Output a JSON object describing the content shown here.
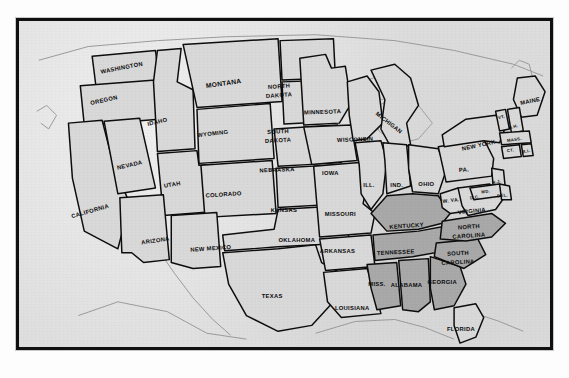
{
  "figure": {
    "kind": "printed-map",
    "title_visible": false,
    "frame_color": "#101010",
    "paper_color": "#dcdcdc",
    "state_fill": "#d9d9d9",
    "shaded_fill": "#a9a9a9",
    "outline_color": "#0d0d0d",
    "coastline_color": "#9a9a9a"
  },
  "map": {
    "region": "United States",
    "shaded_group_label": "",
    "states": [
      {
        "name": "WASHINGTON",
        "size": "sm",
        "shaded": false,
        "x": 104,
        "y": 48,
        "rot": -11
      },
      {
        "name": "OREGON",
        "size": "sm",
        "shaded": false,
        "x": 86,
        "y": 81,
        "rot": -12
      },
      {
        "name": "IDAHO",
        "size": "sm",
        "shaded": false,
        "x": 140,
        "y": 103,
        "rot": -13
      },
      {
        "name": "MONTANA",
        "size": "md",
        "shaded": false,
        "x": 207,
        "y": 64,
        "rot": -8
      },
      {
        "name": "NORTH",
        "size": "sm",
        "shaded": false,
        "x": 263,
        "y": 67,
        "rot": -4
      },
      {
        "name": "DAKOTA",
        "size": "sm",
        "shaded": false,
        "x": 263,
        "y": 76,
        "rot": -4
      },
      {
        "name": "SOUTH",
        "size": "sm",
        "shaded": false,
        "x": 262,
        "y": 113,
        "rot": -3
      },
      {
        "name": "DAKOTA",
        "size": "sm",
        "shaded": false,
        "x": 262,
        "y": 122,
        "rot": -3
      },
      {
        "name": "WYOMING",
        "size": "sm",
        "shaded": false,
        "x": 196,
        "y": 115,
        "rot": -7
      },
      {
        "name": "NEBRASKA",
        "size": "sm",
        "shaded": false,
        "x": 261,
        "y": 152,
        "rot": -2
      },
      {
        "name": "NEVADA",
        "size": "sm",
        "shaded": false,
        "x": 112,
        "y": 147,
        "rot": -13
      },
      {
        "name": "UTAH",
        "size": "sm",
        "shaded": false,
        "x": 155,
        "y": 167,
        "rot": -9
      },
      {
        "name": "COLORADO",
        "size": "sm",
        "shaded": false,
        "x": 207,
        "y": 177,
        "rot": -4
      },
      {
        "name": "KANSAS",
        "size": "sm",
        "shaded": false,
        "x": 268,
        "y": 193,
        "rot": -1
      },
      {
        "name": "CALIFORNIA",
        "size": "sm",
        "shaded": false,
        "x": 72,
        "y": 194,
        "rot": -16
      },
      {
        "name": "ARIZONA",
        "size": "sm",
        "shaded": false,
        "x": 138,
        "y": 224,
        "rot": -8
      },
      {
        "name": "NEW MEXICO",
        "size": "sm",
        "shaded": false,
        "x": 194,
        "y": 232,
        "rot": -4
      },
      {
        "name": "OKLAHOMA",
        "size": "sm",
        "shaded": false,
        "x": 281,
        "y": 224,
        "rot": 0
      },
      {
        "name": "TEXAS",
        "size": "sm",
        "shaded": false,
        "x": 256,
        "y": 281,
        "rot": 0
      },
      {
        "name": "MINNESOTA",
        "size": "sm",
        "shaded": false,
        "x": 307,
        "y": 93,
        "rot": -2
      },
      {
        "name": "WISCONSIN",
        "size": "sm",
        "shaded": false,
        "x": 340,
        "y": 121,
        "rot": -2
      },
      {
        "name": "IOWA",
        "size": "sm",
        "shaded": false,
        "x": 315,
        "y": 155,
        "rot": 0
      },
      {
        "name": "MICHIGAN",
        "size": "sm",
        "shaded": false,
        "x": 374,
        "y": 104,
        "rot": 38
      },
      {
        "name": "MISSOURI",
        "size": "sm",
        "shaded": false,
        "x": 325,
        "y": 197,
        "rot": 0
      },
      {
        "name": "ILL.",
        "size": "sm",
        "shaded": false,
        "x": 354,
        "y": 168,
        "rot": 0
      },
      {
        "name": "IND.",
        "size": "sm",
        "shaded": false,
        "x": 382,
        "y": 168,
        "rot": 0
      },
      {
        "name": "OHIO",
        "size": "sm",
        "shaded": false,
        "x": 412,
        "y": 166,
        "rot": 0
      },
      {
        "name": "ARKANSAS",
        "size": "sm",
        "shaded": false,
        "x": 322,
        "y": 235,
        "rot": 0
      },
      {
        "name": "LOUISIANA",
        "size": "sm",
        "shaded": false,
        "x": 337,
        "y": 293,
        "rot": 0
      },
      {
        "name": "MISS.",
        "size": "sm",
        "shaded": true,
        "x": 362,
        "y": 268,
        "rot": 0
      },
      {
        "name": "ALABAMA",
        "size": "sm",
        "shaded": true,
        "x": 392,
        "y": 269,
        "rot": 0
      },
      {
        "name": "TENNESSEE",
        "size": "sm",
        "shaded": true,
        "x": 381,
        "y": 236,
        "rot": -3
      },
      {
        "name": "KENTUCKY",
        "size": "sm",
        "shaded": true,
        "x": 392,
        "y": 209,
        "rot": -4
      },
      {
        "name": "GEORGIA",
        "size": "sm",
        "shaded": true,
        "x": 428,
        "y": 266,
        "rot": 0
      },
      {
        "name": "SOUTH",
        "size": "sm",
        "shaded": true,
        "x": 444,
        "y": 237,
        "rot": -3
      },
      {
        "name": "CAROLINA",
        "size": "sm",
        "shaded": true,
        "x": 444,
        "y": 246,
        "rot": -3
      },
      {
        "name": "NORTH",
        "size": "sm",
        "shaded": true,
        "x": 455,
        "y": 210,
        "rot": -4
      },
      {
        "name": "CAROLINA",
        "size": "sm",
        "shaded": true,
        "x": 455,
        "y": 219,
        "rot": -4
      },
      {
        "name": "VIRGINIA",
        "size": "sm",
        "shaded": false,
        "x": 458,
        "y": 194,
        "rot": -6
      },
      {
        "name": "W. VA.",
        "size": "xs",
        "shaded": false,
        "x": 437,
        "y": 183,
        "rot": -6
      },
      {
        "name": "PA.",
        "size": "sm",
        "shaded": false,
        "x": 450,
        "y": 152,
        "rot": -4
      },
      {
        "name": "NEW YORK",
        "size": "sm",
        "shaded": false,
        "x": 465,
        "y": 127,
        "rot": -12
      },
      {
        "name": "MAINE",
        "size": "sm",
        "shaded": false,
        "x": 517,
        "y": 82,
        "rot": -12
      },
      {
        "name": "VT.",
        "size": "xxs",
        "shaded": false,
        "x": 488,
        "y": 98,
        "rot": -14
      },
      {
        "name": "N.H.",
        "size": "xxs",
        "shaded": false,
        "x": 500,
        "y": 108,
        "rot": -14
      },
      {
        "name": "MASS.",
        "size": "xxs",
        "shaded": false,
        "x": 501,
        "y": 121,
        "rot": -8
      },
      {
        "name": "CT.",
        "size": "xxs",
        "shaded": false,
        "x": 497,
        "y": 132,
        "rot": -8
      },
      {
        "name": "R.I.",
        "size": "xxs",
        "shaded": false,
        "x": 513,
        "y": 133,
        "rot": -14
      },
      {
        "name": "N.J.",
        "size": "xxs",
        "shaded": false,
        "x": 483,
        "y": 164,
        "rot": -10
      },
      {
        "name": "MD.",
        "size": "xxs",
        "shaded": false,
        "x": 472,
        "y": 174,
        "rot": -8
      },
      {
        "name": "D.C.",
        "size": "xxs",
        "shaded": false,
        "x": 461,
        "y": 180,
        "rot": -8
      },
      {
        "name": "DEL.",
        "size": "xxs",
        "shaded": false,
        "x": 489,
        "y": 178,
        "rot": -6
      },
      {
        "name": "FLORIDA",
        "size": "sm",
        "shaded": false,
        "x": 447,
        "y": 314,
        "rot": 0
      }
    ]
  }
}
